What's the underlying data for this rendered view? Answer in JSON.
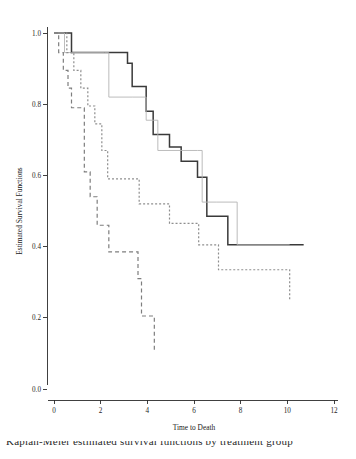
{
  "figure": {
    "background": "#ffffff",
    "caption_partial": "Kaplan-Meier estimated survival functions by treatment group"
  },
  "chart_data": {
    "type": "line",
    "title": "",
    "subtitle": "",
    "xlabel": "Time to Death",
    "ylabel": "Estimated Survival Functions",
    "xlim": [
      0,
      12
    ],
    "ylim": [
      0.0,
      1.0
    ],
    "xticks": [
      0,
      2,
      4,
      6,
      8,
      10,
      12
    ],
    "xticklabels": [
      "0",
      "2",
      "4",
      "6",
      "8",
      "10",
      "12"
    ],
    "yticks": [
      0.0,
      0.2,
      0.4,
      0.6,
      0.8,
      1.0
    ],
    "yticklabels": [
      "0.0",
      "0.2",
      "0.4",
      "0.6",
      "0.8",
      "1.0"
    ],
    "grid": false,
    "legend": "none",
    "step_type": "post",
    "series": [
      {
        "name": "group-1-solid",
        "style": "solid",
        "color": "#3a3a3a",
        "width": 1.5,
        "x": [
          0.0,
          0.55,
          0.75,
          1.55,
          2.35,
          3.15,
          3.35,
          3.75,
          3.95,
          4.25,
          4.95,
          5.45,
          6.15,
          6.35,
          6.55,
          7.45,
          10.7
        ],
        "y": [
          1.0,
          1.0,
          0.945,
          0.945,
          0.945,
          0.915,
          0.85,
          0.85,
          0.78,
          0.715,
          0.68,
          0.64,
          0.595,
          0.595,
          0.485,
          0.405,
          0.405
        ]
      },
      {
        "name": "group-2-thin-gray",
        "style": "solid",
        "color": "#b4b4b4",
        "width": 0.9,
        "x": [
          0.0,
          0.25,
          0.45,
          2.15,
          2.35,
          3.35,
          3.95,
          4.25,
          4.45,
          6.15,
          6.35,
          6.95,
          7.85,
          10.1
        ],
        "y": [
          1.0,
          1.0,
          0.945,
          0.945,
          0.82,
          0.82,
          0.755,
          0.755,
          0.67,
          0.67,
          0.525,
          0.525,
          0.405,
          0.405
        ]
      },
      {
        "name": "group-3-short-dash",
        "style": "dotted",
        "color": "#8e8e8e",
        "width": 1.2,
        "dash": "2,2",
        "x": [
          0.0,
          0.3,
          0.55,
          0.85,
          1.15,
          1.45,
          1.75,
          2.05,
          2.3,
          3.35,
          3.65,
          4.55,
          4.95,
          5.45,
          6.2,
          6.45,
          7.05,
          7.7,
          10.1
        ],
        "y": [
          1.0,
          1.0,
          0.945,
          0.895,
          0.845,
          0.795,
          0.745,
          0.67,
          0.59,
          0.59,
          0.52,
          0.52,
          0.465,
          0.465,
          0.405,
          0.405,
          0.335,
          0.335,
          0.25
        ]
      },
      {
        "name": "group-4-long-dash",
        "style": "dashed",
        "color": "#7e7e7e",
        "width": 1.2,
        "dash": "4,3",
        "x": [
          0.0,
          0.2,
          0.4,
          0.6,
          0.75,
          1.0,
          1.3,
          1.55,
          1.85,
          2.1,
          2.35,
          3.6,
          3.75,
          4.3
        ],
        "y": [
          1.0,
          0.945,
          0.895,
          0.845,
          0.79,
          0.79,
          0.61,
          0.54,
          0.46,
          0.46,
          0.385,
          0.31,
          0.205,
          0.11
        ]
      }
    ]
  }
}
